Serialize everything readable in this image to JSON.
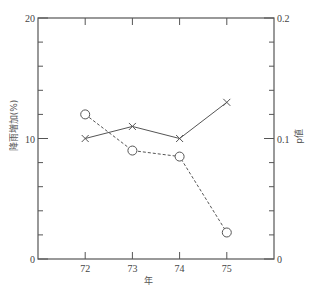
{
  "chart_data": {
    "type": "line",
    "title": "",
    "xlabel": "年",
    "ylabel": "降雨増加(%)",
    "ylabel_right": "p値",
    "xlim": [
      71,
      76
    ],
    "ylim": [
      0,
      20
    ],
    "ylim_right": [
      0,
      0.2
    ],
    "x_ticks": [
      72,
      73,
      74,
      75
    ],
    "x_tick_labels": [
      "72",
      "73",
      "74",
      "75"
    ],
    "y_ticks": [
      0,
      10,
      20
    ],
    "y_tick_labels": [
      "0",
      "10",
      "20"
    ],
    "y_minor_step": 2,
    "y_right_ticks": [
      0,
      0.1,
      0.2
    ],
    "y_right_tick_labels": [
      "0",
      "0.1",
      "0.2"
    ],
    "y_right_minor_step": 0.02,
    "grid": false,
    "legend": "none",
    "x": [
      72,
      73,
      74,
      75
    ],
    "series": [
      {
        "name": "降雨増加(%)",
        "axis": "left",
        "marker": "x",
        "line_style": "solid",
        "values": [
          10.0,
          11.0,
          10.0,
          13.0
        ]
      },
      {
        "name": "p値",
        "axis": "right",
        "marker": "circle",
        "line_style": "dashed",
        "values": [
          0.12,
          0.09,
          0.085,
          0.022
        ]
      }
    ],
    "colors": {
      "axis": "#555555",
      "line": "#555555",
      "text": "#444444"
    }
  }
}
